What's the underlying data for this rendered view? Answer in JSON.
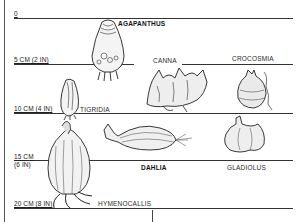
{
  "diagram": {
    "depth_levels": [
      {
        "label": "0",
        "y": 18
      },
      {
        "label": "5 CM (2 IN)",
        "y": 64
      },
      {
        "label": "10 CM (4 IN)",
        "y": 113
      },
      {
        "label": "15 CM",
        "label2": "(6 IN)",
        "y": 160
      },
      {
        "label": "20 CM (8 IN)",
        "y": 208
      }
    ],
    "plants": [
      {
        "name": "AGAPANTHUS",
        "depth": "5 CM (2 IN)",
        "emphasis": true
      },
      {
        "name": "CANNA",
        "depth": "10 CM (4 IN)",
        "emphasis": false
      },
      {
        "name": "CROCOSMIA",
        "depth": "10 CM (4 IN)",
        "emphasis": false
      },
      {
        "name": "TIGRIDIA",
        "depth": "10 CM (4 IN)",
        "emphasis": false
      },
      {
        "name": "DAHLIA",
        "depth": "15 CM (6 IN)",
        "emphasis": true
      },
      {
        "name": "GLADIOLUS",
        "depth": "15 CM (6 IN)",
        "emphasis": false
      },
      {
        "name": "HYMENOCALLIS",
        "depth": "20 CM (8 IN)",
        "emphasis": false
      }
    ],
    "colors": {
      "ink": "#1a1a1a",
      "line": "#333333",
      "background": "#ffffff"
    }
  }
}
